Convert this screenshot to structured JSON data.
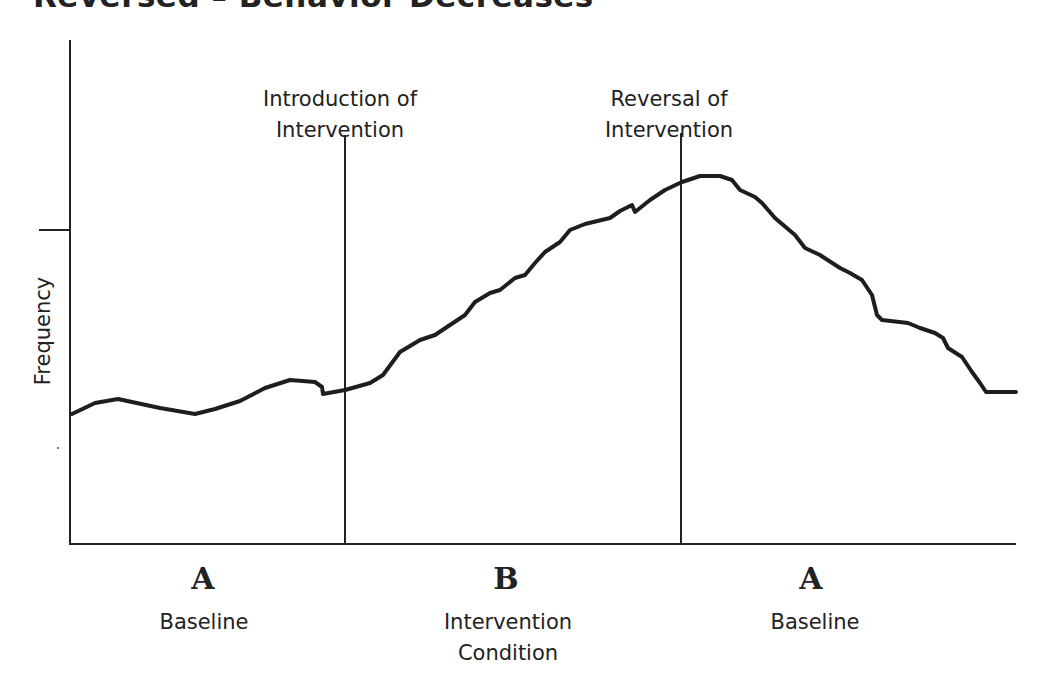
{
  "title": "Reversed – Behavior Decreases",
  "annotations": [
    {
      "line1": "Introduction of",
      "line2": "Intervention"
    },
    {
      "line1": "Reversal of",
      "line2": "Intervention"
    }
  ],
  "phases": [
    {
      "letter": "A",
      "name": "Baseline",
      "name2": ""
    },
    {
      "letter": "B",
      "name": "Intervention",
      "name2": "Condition"
    },
    {
      "letter": "A",
      "name": "Baseline",
      "name2": ""
    }
  ],
  "chart_data": {
    "type": "line",
    "title": "Reversed – Behavior Decreases",
    "xlabel": "",
    "ylabel": "Frequency",
    "grid": false,
    "legend": null,
    "design": "A-B-A reversal design",
    "phases": [
      {
        "label": "A",
        "name": "Baseline",
        "x_range": [
          0,
          0.29
        ]
      },
      {
        "label": "B",
        "name": "Intervention Condition",
        "x_range": [
          0.29,
          0.645
        ]
      },
      {
        "label": "A",
        "name": "Baseline",
        "x_range": [
          0.645,
          1.0
        ]
      }
    ],
    "phase_change_lines": [
      {
        "x": 0.29,
        "label": "Introduction of Intervention"
      },
      {
        "x": 0.645,
        "label": "Reversal of Intervention"
      }
    ],
    "y_ticks": [
      {
        "y": 0.62,
        "label": ""
      }
    ],
    "series": [
      {
        "name": "Frequency",
        "points_pixel": [
          [
            72,
            414
          ],
          [
            95,
            403
          ],
          [
            118,
            399
          ],
          [
            160,
            408
          ],
          [
            195,
            414
          ],
          [
            215,
            409
          ],
          [
            240,
            401
          ],
          [
            265,
            388
          ],
          [
            290,
            380
          ],
          [
            315,
            382
          ],
          [
            322,
            387
          ],
          [
            323,
            394
          ],
          [
            345,
            390
          ],
          [
            370,
            383
          ],
          [
            383,
            375
          ],
          [
            400,
            352
          ],
          [
            420,
            340
          ],
          [
            435,
            335
          ],
          [
            450,
            325
          ],
          [
            465,
            315
          ],
          [
            475,
            302
          ],
          [
            490,
            293
          ],
          [
            500,
            290
          ],
          [
            515,
            278
          ],
          [
            525,
            275
          ],
          [
            535,
            263
          ],
          [
            545,
            252
          ],
          [
            560,
            242
          ],
          [
            570,
            230
          ],
          [
            585,
            224
          ],
          [
            610,
            218
          ],
          [
            620,
            211
          ],
          [
            632,
            205
          ],
          [
            635,
            212
          ],
          [
            650,
            200
          ],
          [
            665,
            190
          ],
          [
            682,
            182
          ],
          [
            700,
            176
          ],
          [
            720,
            176
          ],
          [
            732,
            180
          ],
          [
            740,
            190
          ],
          [
            755,
            197
          ],
          [
            762,
            203
          ],
          [
            775,
            218
          ],
          [
            795,
            235
          ],
          [
            805,
            248
          ],
          [
            820,
            255
          ],
          [
            840,
            268
          ],
          [
            850,
            273
          ],
          [
            862,
            280
          ],
          [
            872,
            295
          ],
          [
            877,
            315
          ],
          [
            882,
            320
          ],
          [
            908,
            323
          ],
          [
            920,
            328
          ],
          [
            935,
            333
          ],
          [
            943,
            338
          ],
          [
            948,
            348
          ],
          [
            962,
            357
          ],
          [
            972,
            372
          ],
          [
            980,
            383
          ],
          [
            986,
            392
          ],
          [
            1016,
            392
          ]
        ],
        "trend": "Low stable baseline, rises steadily during intervention to peak just after reversal, then decreases back toward baseline"
      }
    ]
  },
  "layout": {
    "axis_color": "#222222",
    "line_color": "#1e1e1e",
    "origin": [
      70,
      544
    ],
    "y_top": 40,
    "x_right": 1016,
    "tick_y": 230,
    "phase_lines_x": [
      345,
      681
    ],
    "phase_lines_top": [
      135,
      133
    ]
  }
}
